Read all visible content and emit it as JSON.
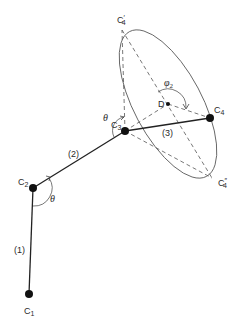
{
  "diagram": {
    "type": "linkage-rotation-cone",
    "nodes": [
      {
        "id": "C1",
        "label": "C",
        "sub": "1",
        "x": 29,
        "y": 294
      },
      {
        "id": "C2",
        "label": "C",
        "sub": "2",
        "x": 33,
        "y": 188
      },
      {
        "id": "C3",
        "label": "C",
        "sub": "3",
        "x": 125,
        "y": 131
      },
      {
        "id": "C4",
        "label": "C",
        "sub": "4",
        "x": 210,
        "y": 118
      },
      {
        "id": "D",
        "label": "D",
        "x": 168,
        "y": 104
      }
    ],
    "cone_points": [
      {
        "id": "C4prime",
        "label": "C",
        "sub": "4",
        "prime": "′"
      },
      {
        "id": "C4doubleprime",
        "label": "C",
        "sub": "4",
        "prime": "″"
      }
    ],
    "bonds": [
      {
        "label": "(1)",
        "from": "C1",
        "to": "C2"
      },
      {
        "label": "(2)",
        "from": "C2",
        "to": "C3"
      },
      {
        "label": "(3)",
        "from": "C3",
        "to": "C4"
      }
    ],
    "angles": [
      {
        "label": "θ",
        "at": "C2"
      },
      {
        "label": "θ",
        "at": "C3"
      },
      {
        "label": "φ",
        "sub": "2",
        "at": "D"
      }
    ]
  }
}
